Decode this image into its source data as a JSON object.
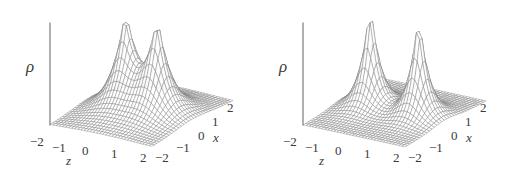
{
  "figure": {
    "type": "surface-plot-pair",
    "background_color": "#ffffff",
    "line_color": "#7d7d7d",
    "axis_color": "#6e6e6e",
    "text_color": "#3a3a3a"
  },
  "panels": [
    {
      "id": "left",
      "vertical_axis_label": "ρ",
      "z_axis_name": "z",
      "x_axis_name": "x",
      "z_ticks": [
        "−2",
        "−1",
        "0",
        "1",
        "2"
      ],
      "x_ticks": [
        "−2",
        "−1",
        "0",
        "1",
        "2"
      ]
    },
    {
      "id": "right",
      "vertical_axis_label": "ρ",
      "z_axis_name": "z",
      "x_axis_name": "x",
      "z_ticks": [
        "−2",
        "−1",
        "0",
        "1",
        "2"
      ],
      "x_ticks": [
        "−2",
        "−1",
        "0",
        "1",
        "2"
      ]
    }
  ],
  "chart_data": [
    {
      "type": "surface",
      "id": "left-surface",
      "title": "",
      "xlabel": "z",
      "ylabel": "x",
      "zlabel": "ρ",
      "xlim": [
        -2,
        2
      ],
      "ylim": [
        -2,
        2
      ],
      "zlim": [
        0,
        1
      ],
      "grid": true,
      "legend": "none",
      "grid_n": 33,
      "description": "Electron density rho(x,z) with two cusped maxima on the z-axis; peaks close together with a raised saddle between them (bonded configuration).",
      "function": "sum of exponential cusps exp(-r/a)",
      "centers": [
        {
          "z": -0.62,
          "x": 0.0,
          "amplitude": 1.0,
          "decay": 0.46
        },
        {
          "z": 0.62,
          "x": 0.0,
          "amplitude": 1.0,
          "decay": 0.46
        }
      ],
      "peak_z_values": [
        -0.62,
        0.62
      ],
      "saddle_value": 0.47,
      "max_value": 1.0
    },
    {
      "type": "surface",
      "id": "right-surface",
      "title": "",
      "xlabel": "z",
      "ylabel": "x",
      "zlabel": "ρ",
      "xlim": [
        -2,
        2
      ],
      "ylim": [
        -2,
        2
      ],
      "zlim": [
        0,
        1
      ],
      "grid": true,
      "legend": "none",
      "grid_n": 33,
      "description": "Electron density rho(x,z) with two sharply separated cusped maxima on the z-axis and a deep minimum between them (separated/dissociating configuration).",
      "function": "sum of exponential cusps exp(-r/a)",
      "centers": [
        {
          "z": -0.95,
          "x": 0.0,
          "amplitude": 1.0,
          "decay": 0.33
        },
        {
          "z": 0.95,
          "x": 0.0,
          "amplitude": 1.0,
          "decay": 0.33
        }
      ],
      "peak_z_values": [
        -0.95,
        0.95
      ],
      "saddle_value": 0.17,
      "max_value": 1.0
    }
  ]
}
